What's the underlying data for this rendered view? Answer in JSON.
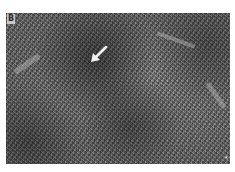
{
  "figure": {
    "panel_label": "B",
    "arrow_icon": "arrow-pointing-down-left",
    "corner_marker": "*",
    "colors": {
      "background": "#ffffff",
      "tissue_mid": "#6e6e6e",
      "label_box": "#c8c8c8",
      "arrow": "#f2f2f2"
    }
  }
}
